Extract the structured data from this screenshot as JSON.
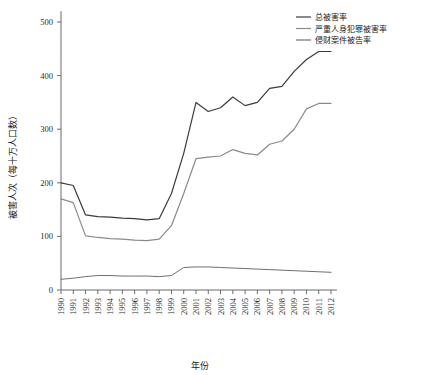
{
  "chart_data": {
    "type": "line",
    "title": "",
    "xlabel": "年份",
    "ylabel": "被害人次（每十万人口数）",
    "x": [
      1990,
      1991,
      1992,
      1993,
      1994,
      1995,
      1996,
      1997,
      1998,
      1999,
      2000,
      2001,
      2002,
      2003,
      2004,
      2005,
      2006,
      2007,
      2008,
      2009,
      2010,
      2011,
      2012
    ],
    "xtick_labels": [
      "1990",
      "1991",
      "1992",
      "1993",
      "1994",
      "1995",
      "1996",
      "1997",
      "1998",
      "1999",
      "2000",
      "2001",
      "2002",
      "2003",
      "2004",
      "2005",
      "2006",
      "2007",
      "2008",
      "2009",
      "2010",
      "2011",
      "2012"
    ],
    "ytick_labels": [
      "0",
      "100",
      "200",
      "300",
      "400",
      "500"
    ],
    "yticks": [
      0,
      100,
      200,
      300,
      400,
      500
    ],
    "ylim": [
      0,
      520
    ],
    "xlim": [
      1990,
      2012
    ],
    "grid": false,
    "legend_position": "top-right",
    "series": [
      {
        "name": "总被害率",
        "color": "#3a3a42",
        "width": 1.2,
        "values": [
          200,
          195,
          140,
          137,
          136,
          134,
          133,
          131,
          133,
          180,
          255,
          350,
          333,
          340,
          360,
          344,
          350,
          376,
          380,
          408,
          430,
          445,
          445
        ]
      },
      {
        "name": "严重人身犯罪被害率",
        "color": "#8a8a8a",
        "width": 1.2,
        "values": [
          170,
          163,
          101,
          98,
          96,
          95,
          93,
          92,
          95,
          120,
          180,
          245,
          248,
          250,
          262,
          255,
          252,
          272,
          278,
          300,
          338,
          348,
          348
        ]
      },
      {
        "name": "侵财案件被告率",
        "color": "#6f6f6f",
        "width": 1.0,
        "values": [
          20,
          22,
          25,
          27,
          27,
          26,
          26,
          26,
          25,
          27,
          42,
          43,
          43,
          42,
          41,
          40,
          39,
          38,
          37,
          36,
          35,
          34,
          33
        ]
      }
    ]
  },
  "legend": {
    "items": [
      {
        "label": "总被害率"
      },
      {
        "label": "严重人身犯罪被害率"
      },
      {
        "label": "侵财案件被告率"
      }
    ]
  },
  "axes": {
    "x_title": "年份",
    "y_title": "被害人次（每十万人口数）"
  }
}
